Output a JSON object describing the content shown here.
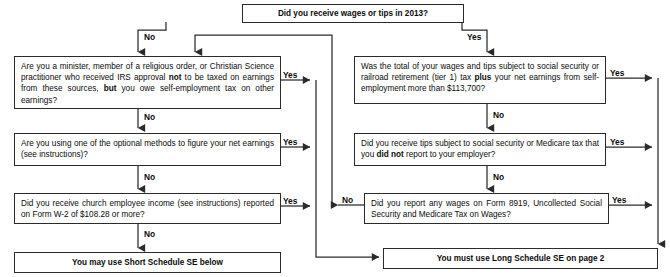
{
  "nodes": {
    "start": {
      "id": "start",
      "text": "Did you receive wages or tips in 2013?",
      "kind": "decision"
    },
    "minister": {
      "id": "minister",
      "html": "Are you a minister, member of a religious order, or Christian Science practitioner who received IRS approval <b>not</b> to be taxed on earnings from these sources, <b>but</b> you owe self-employment tax on other earnings?",
      "text": "Are you a minister, member of a religious order, or Christian Science practitioner who received IRS approval not to be taxed on earnings from these sources, but you owe self-employment tax on other earnings?",
      "kind": "decision"
    },
    "optional_methods": {
      "id": "optional_methods",
      "html": "Are you using one of the optional methods to figure your net earnings (see instructions)?",
      "text": "Are you using one of the optional methods to figure your net earnings (see instructions)?",
      "kind": "decision"
    },
    "church_income": {
      "id": "church_income",
      "html": "Did you receive church employee income (see instructions) reported on Form  W-2 of $108.28 or more?",
      "text": "Did you receive church employee income (see instructions) reported on Form W-2 of $108.28 or more?",
      "kind": "decision"
    },
    "wage_limit": {
      "id": "wage_limit",
      "html": "Was the total of your wages and tips subject to social security or railroad retirement (tier 1) tax <b>plus</b> your net earnings from self-employment more than $113,700?",
      "text": "Was the total of your wages and tips subject to social security or railroad retirement (tier 1) tax plus your net earnings from self-employment more than $113,700?",
      "kind": "decision"
    },
    "unreported_tips": {
      "id": "unreported_tips",
      "html": "Did you receive tips subject to social security or Medicare tax that you <b>did not</b> report to your employer?",
      "text": "Did you receive tips subject to social security or Medicare tax that you did not report to your employer?",
      "kind": "decision"
    },
    "form_8919": {
      "id": "form_8919",
      "html": "Did you report any wages on Form 8919, Uncollected Social Security and Medicare Tax on Wages?",
      "text": "Did you report any wages on Form 8919, Uncollected Social Security and Medicare Tax on Wages?",
      "kind": "decision"
    },
    "short_se": {
      "id": "short_se",
      "text": "You may use Short Schedule SE below",
      "kind": "terminal"
    },
    "long_se": {
      "id": "long_se",
      "text": "You must use Long Schedule SE on page 2",
      "kind": "terminal"
    }
  },
  "edge_labels": {
    "start_no": "No",
    "start_yes": "Yes",
    "minister_yes": "Yes",
    "minister_no": "No",
    "optional_yes": "Yes",
    "optional_no": "No",
    "church_yes": "Yes",
    "church_no": "No",
    "wage_limit_yes": "Yes",
    "wage_limit_no": "No",
    "tips_yes": "Yes",
    "tips_no": "No",
    "f8919_yes": "Yes",
    "f8919_no": "No"
  },
  "colors": {
    "line": "#2b2b2b",
    "box_border": "#2b2b2b",
    "text": "#0b0b0b",
    "background": "#ffffff"
  }
}
